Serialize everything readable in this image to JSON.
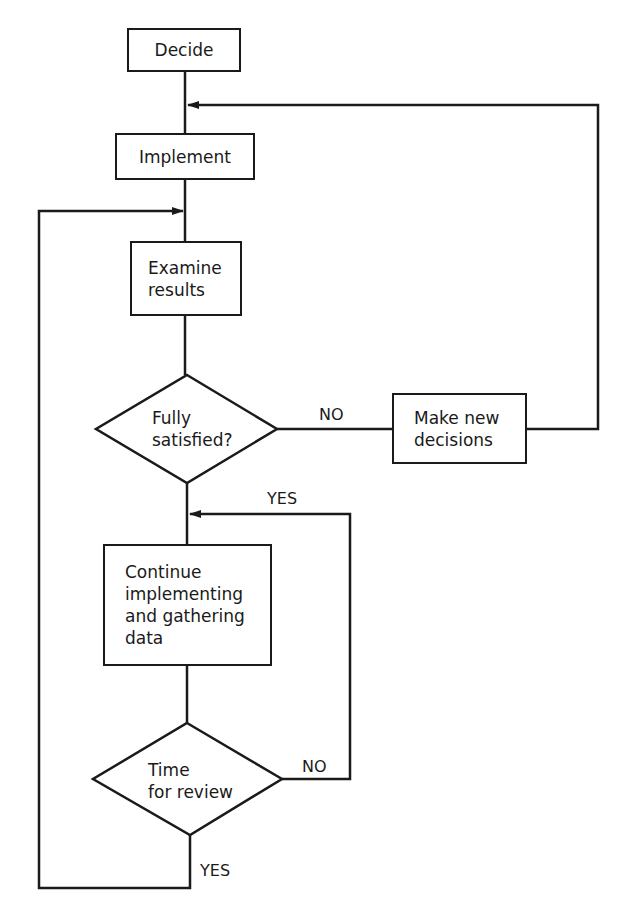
{
  "diagram": {
    "type": "flowchart",
    "nodes": {
      "decide": {
        "shape": "rectangle",
        "label": "Decide"
      },
      "implement": {
        "shape": "rectangle",
        "label": "Implement"
      },
      "examine": {
        "shape": "rectangle",
        "lines": [
          "Examine",
          "results"
        ]
      },
      "fully_satisfied": {
        "shape": "diamond",
        "lines": [
          "Fully",
          "satisfied?"
        ]
      },
      "make_new_decisions": {
        "shape": "rectangle",
        "lines": [
          "Make new",
          "decisions"
        ]
      },
      "continue": {
        "shape": "rectangle",
        "lines": [
          "Continue",
          "implementing",
          "and gathering",
          "data"
        ]
      },
      "time_for_review": {
        "shape": "diamond",
        "lines": [
          "Time",
          "for review"
        ]
      }
    },
    "edge_labels": {
      "satisfied_no": "NO",
      "satisfied_yes": "YES",
      "review_no": "NO",
      "review_yes": "YES"
    },
    "edges": [
      {
        "from": "Decide",
        "to": "Implement"
      },
      {
        "from": "Implement",
        "to": "Examine results"
      },
      {
        "from": "Examine results",
        "to": "Fully satisfied?"
      },
      {
        "from": "Fully satisfied?",
        "to": "Make new decisions",
        "label": "NO"
      },
      {
        "from": "Make new decisions",
        "to": "Implement"
      },
      {
        "from": "Fully satisfied?",
        "to": "Continue implementing and gathering data",
        "label": "YES"
      },
      {
        "from": "Continue implementing and gathering data",
        "to": "Time for review"
      },
      {
        "from": "Time for review",
        "to": "Continue implementing and gathering data",
        "label": "NO"
      },
      {
        "from": "Time for review",
        "to": "Examine results",
        "label": "YES"
      }
    ]
  }
}
